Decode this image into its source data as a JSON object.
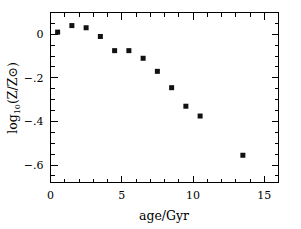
{
  "chart_data": {
    "type": "scatter",
    "title": "",
    "xlabel": "age/Gyr",
    "ylabel": "log10(Z/Zsun)",
    "ylabel_parts": {
      "log": "log",
      "sub": "10",
      "rest": "(Z/Z⊙)"
    },
    "xlim": [
      0,
      16
    ],
    "ylim": [
      -0.68,
      0.1
    ],
    "grid": false,
    "legend": null,
    "xticks_major": [
      0,
      5,
      10,
      15
    ],
    "xticklabels": [
      "0",
      "5",
      "10",
      "15"
    ],
    "xtick_minor_step": 1,
    "yticks_major": [
      0,
      -0.2,
      -0.4,
      -0.6
    ],
    "yticklabels": [
      "0",
      "−.2",
      "−.4",
      "−.6"
    ],
    "ytick_minor_step": 0.05,
    "marker": "filled-square",
    "marker_color": "#111111",
    "x": [
      0.5,
      1.5,
      2.5,
      3.5,
      4.5,
      5.5,
      6.5,
      7.5,
      8.5,
      9.5,
      10.5,
      13.5
    ],
    "y": [
      0.01,
      0.04,
      0.03,
      -0.01,
      -0.075,
      -0.075,
      -0.11,
      -0.17,
      -0.245,
      -0.33,
      -0.375,
      -0.555
    ],
    "points": [
      {
        "age": 0.5,
        "logZ": 0.01
      },
      {
        "age": 1.5,
        "logZ": 0.04
      },
      {
        "age": 2.5,
        "logZ": 0.03
      },
      {
        "age": 3.5,
        "logZ": -0.01
      },
      {
        "age": 4.5,
        "logZ": -0.075
      },
      {
        "age": 5.5,
        "logZ": -0.075
      },
      {
        "age": 6.5,
        "logZ": -0.11
      },
      {
        "age": 7.5,
        "logZ": -0.17
      },
      {
        "age": 8.5,
        "logZ": -0.245
      },
      {
        "age": 9.5,
        "logZ": -0.33
      },
      {
        "age": 10.5,
        "logZ": -0.375
      },
      {
        "age": 13.5,
        "logZ": -0.555
      }
    ]
  },
  "axes": {
    "x_title": "age/Gyr",
    "y_title_log": "log",
    "y_title_sub": "10",
    "y_title_rest": "(Z/Z⊙)",
    "x_tick_labels": [
      "0",
      "5",
      "10",
      "15"
    ],
    "y_tick_labels": [
      "0",
      "−.2",
      "−.4",
      "−.6"
    ]
  },
  "colors": {
    "background": "#ffffff",
    "axis": "#000000",
    "marker": "#111111"
  }
}
